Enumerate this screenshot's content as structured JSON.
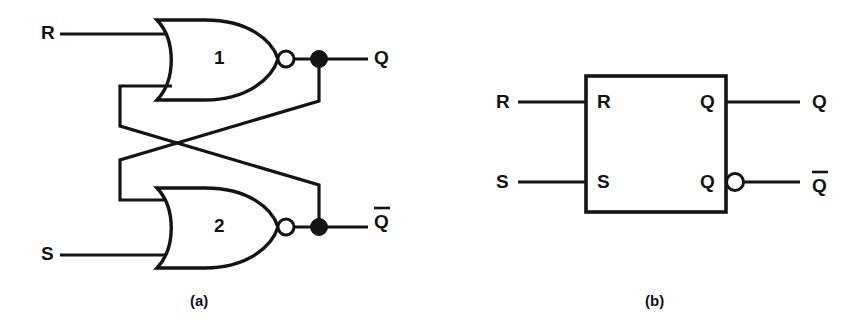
{
  "figure": {
    "kind": "logic-circuit-diagram",
    "ink_color": "#141414",
    "background_color": "#ffffff",
    "panels": [
      {
        "id": "a",
        "caption": "(a)",
        "type": "gate-level-schematic",
        "inputs": [
          {
            "name": "R",
            "label": "R",
            "gate": "1"
          },
          {
            "name": "S",
            "label": "S",
            "gate": "2"
          }
        ],
        "gates": [
          {
            "number": "1",
            "type": "NOR",
            "label": "1",
            "inputs": [
              "R",
              "Qbar-feedback"
            ],
            "output": "Q"
          },
          {
            "number": "2",
            "type": "NOR",
            "label": "2",
            "inputs": [
              "Q-feedback",
              "S"
            ],
            "output": "Qbar"
          }
        ],
        "outputs": [
          {
            "name": "Q",
            "label": "Q",
            "overline": false
          },
          {
            "name": "Qbar",
            "label": "Q",
            "overline": true
          }
        ],
        "junction_dots": 2,
        "inverting_bubbles": 2,
        "feedback": "cross-coupled"
      },
      {
        "id": "b",
        "caption": "(b)",
        "type": "block-symbol",
        "box_pins_left": [
          {
            "name": "R",
            "label": "R"
          },
          {
            "name": "S",
            "label": "S"
          }
        ],
        "box_pins_right": [
          {
            "name": "Q",
            "label": "Q",
            "inverting_bubble": false
          },
          {
            "name": "Qbar",
            "label": "Q",
            "inverting_bubble": true
          }
        ],
        "external_labels_left": [
          {
            "name": "R",
            "label": "R"
          },
          {
            "name": "S",
            "label": "S"
          }
        ],
        "external_labels_right": [
          {
            "name": "Q",
            "label": "Q",
            "overline": false
          },
          {
            "name": "Qbar",
            "label": "Q",
            "overline": true
          }
        ],
        "inverting_bubbles": 1
      }
    ]
  }
}
